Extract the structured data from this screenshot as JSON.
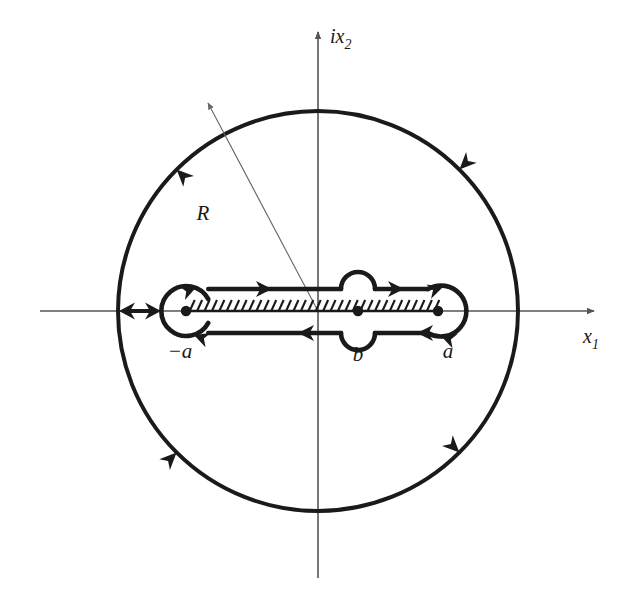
{
  "figure": {
    "type": "complex-plane-contour-diagram",
    "background_color": "#ffffff",
    "ink_color": "#1a1a1a",
    "axis_color": "#555555"
  },
  "axes": {
    "horizontal": {
      "label": "x",
      "subscript": "1",
      "name": "real-axis",
      "x_start": 40,
      "x_end": 598,
      "y": 311,
      "arrow": "right"
    },
    "vertical": {
      "label": "ix",
      "subscript": "2",
      "name": "imaginary-axis",
      "y_start": 28,
      "y_end": 578,
      "x": 318,
      "arrow": "up"
    },
    "origin": {
      "x": 318,
      "y": 311
    }
  },
  "big_circle": {
    "name": "radius-R-circle",
    "center": {
      "x": 318,
      "y": 311
    },
    "radius": 200,
    "stroke_width": 4,
    "orientation": "counterclockwise",
    "arrow_angles_deg": [
      135,
      45,
      225,
      315
    ]
  },
  "radius_marker": {
    "label": "R",
    "label_x": 210,
    "label_y": 215,
    "from": {
      "x": 318,
      "y": 311
    },
    "to": {
      "x": 205,
      "y": 97
    },
    "stroke_width": 1,
    "arrow": "to-circle"
  },
  "branch_points": [
    {
      "id": "minus-a",
      "label": "−a",
      "x": 186,
      "y": 311,
      "label_x": 180,
      "label_y": 355,
      "loop_radius": 25,
      "dot_radius": 5
    },
    {
      "id": "b",
      "label": "b",
      "x": 358,
      "y": 311,
      "label_x": 358,
      "label_y": 358,
      "bump_radius": 17,
      "dot_radius": 5
    },
    {
      "id": "a",
      "label": "a",
      "x": 438,
      "y": 311,
      "label_x": 447,
      "label_y": 355,
      "loop_radius": 25,
      "dot_radius": 5
    }
  ],
  "branch_cut": {
    "name": "branch-cut-hatching",
    "x_start": 186,
    "x_end": 438,
    "y": 311,
    "tick_count": 34,
    "tick_length": 11,
    "tick_slant": 5,
    "stroke_width": 2
  },
  "contour": {
    "name": "dogbone-contour",
    "stroke_width": 4.5,
    "upper_y": 289,
    "lower_y": 333,
    "upper_arrows": [
      {
        "x": 268,
        "direction": "right"
      },
      {
        "x": 400,
        "direction": "right"
      }
    ],
    "lower_arrows": [
      {
        "x": 300,
        "direction": "left"
      },
      {
        "x": 415,
        "direction": "left"
      }
    ],
    "loop_arrows": [
      {
        "at": "minus-a-top",
        "direction": "right"
      },
      {
        "at": "minus-a-bottom",
        "direction": "left"
      },
      {
        "at": "a-top",
        "direction": "right"
      },
      {
        "at": "a-bottom",
        "direction": "left"
      }
    ]
  },
  "double_arrow": {
    "name": "radius-span-double-arrow",
    "x_left": 119,
    "x_right": 161,
    "y": 311,
    "stroke_width": 4,
    "heads": "both"
  }
}
